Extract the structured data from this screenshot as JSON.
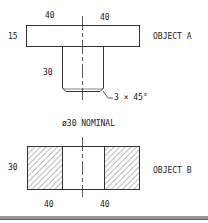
{
  "object_a": {
    "label": "OBJECT A",
    "dim_left_width": "40",
    "dim_right_width": "40",
    "dim_flange_height": "15",
    "dim_stem_height": "30",
    "chamfer_note": "3 × 45°"
  },
  "note": "ø30 NOMINAL",
  "object_b": {
    "label": "OBJECT B",
    "dim_height": "30",
    "dim_left_width": "40",
    "dim_right_width": "40"
  },
  "colors": {
    "line": "#333333",
    "hatch": "#555555"
  }
}
